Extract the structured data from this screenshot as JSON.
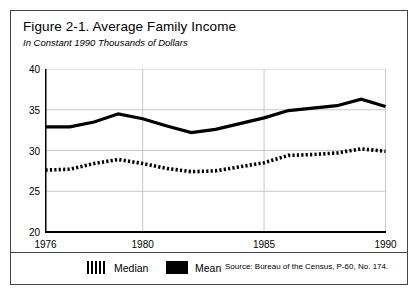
{
  "figure": {
    "title": "Figure 2-1. Average Family Income",
    "subtitle": "In Constant 1990 Thousands of Dollars",
    "source": "Source: Bureau of the Census, P-60, No. 174."
  },
  "legend": {
    "median_label": "Median",
    "mean_label": "Mean",
    "median_swatch": "hatched-bars-swatch",
    "mean_swatch": "solid-black-swatch"
  },
  "colors": {
    "series": "#000000",
    "grid": "#c8c8c8",
    "axis": "#000000",
    "border": "#444444",
    "background": "#ffffff"
  },
  "chart_data": {
    "type": "line",
    "title": "Figure 2-1. Average Family Income",
    "subtitle": "In Constant 1990 Thousands of Dollars",
    "xlabel": "",
    "ylabel": "",
    "units": "Constant 1990 thousands of dollars",
    "xlim": [
      1976,
      1990
    ],
    "ylim": [
      20,
      40
    ],
    "yticks": [
      20,
      25,
      30,
      35,
      40
    ],
    "ytick_labels": [
      "20",
      "25",
      "30",
      "35",
      "40"
    ],
    "xticks": [
      1976,
      1980,
      1985,
      1990
    ],
    "xtick_labels": [
      "1976",
      "1980",
      "1985",
      "1990"
    ],
    "grid": true,
    "grid_axis": "both",
    "legend_position": "below-plot",
    "x": [
      1976,
      1977,
      1978,
      1979,
      1980,
      1981,
      1982,
      1983,
      1984,
      1985,
      1986,
      1987,
      1988,
      1989,
      1990
    ],
    "series": [
      {
        "name": "Mean",
        "style": "solid-thick",
        "values": [
          32.9,
          32.9,
          33.5,
          34.5,
          33.9,
          33.0,
          32.2,
          32.6,
          33.3,
          34.0,
          34.9,
          35.2,
          35.5,
          36.3,
          35.4
        ]
      },
      {
        "name": "Median",
        "style": "dashed-thick",
        "values": [
          27.6,
          27.7,
          28.4,
          28.9,
          28.4,
          27.8,
          27.4,
          27.5,
          28.0,
          28.5,
          29.4,
          29.5,
          29.7,
          30.2,
          29.9
        ]
      }
    ]
  }
}
